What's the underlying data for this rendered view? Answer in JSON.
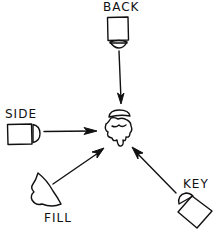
{
  "diagram": {
    "type": "lighting-setup",
    "subject": {
      "name": "subject-head"
    },
    "lights": [
      {
        "id": "back",
        "label": "BACK",
        "position": "top"
      },
      {
        "id": "side",
        "label": "SIDE",
        "position": "left"
      },
      {
        "id": "fill",
        "label": "FILL",
        "position": "bottom-left"
      },
      {
        "id": "key",
        "label": "KEY",
        "position": "bottom-right"
      }
    ],
    "colors": {
      "ink": "#111111",
      "background": "#ffffff"
    }
  }
}
